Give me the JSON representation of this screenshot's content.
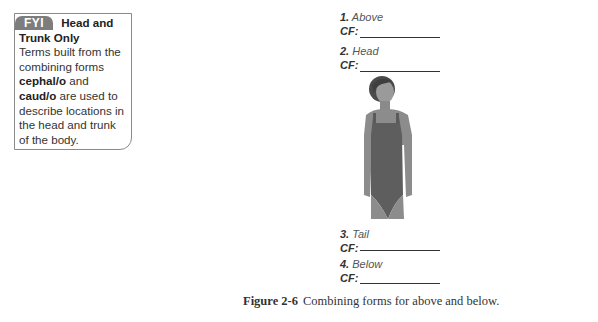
{
  "fyi": {
    "badge": "FYI",
    "title_line1": "Head and",
    "title_line2": "Trunk Only",
    "body_pre": "Terms built from the combining forms ",
    "term1": "cephal/o",
    "body_mid": " and ",
    "term2": "caud/o",
    "body_post": " are used to describe locations in the head and trunk of the body."
  },
  "exercises": [
    {
      "num": "1.",
      "label": "Above",
      "cf_label": "CF:",
      "cf_value": ""
    },
    {
      "num": "2.",
      "label": "Head",
      "cf_label": "CF:",
      "cf_value": ""
    },
    {
      "num": "3.",
      "label": "Tail",
      "cf_label": "CF:",
      "cf_value": ""
    },
    {
      "num": "4.",
      "label": "Below",
      "cf_label": "CF:",
      "cf_value": ""
    }
  ],
  "figure": {
    "illustration": "woman-torso-in-swimsuit",
    "colors": {
      "skin": "#8c8c8c",
      "hair": "#4a4a4a",
      "suit": "#5e5e5e"
    }
  },
  "caption": {
    "label": "Figure 2-6",
    "text": "Combining forms for above and below."
  }
}
